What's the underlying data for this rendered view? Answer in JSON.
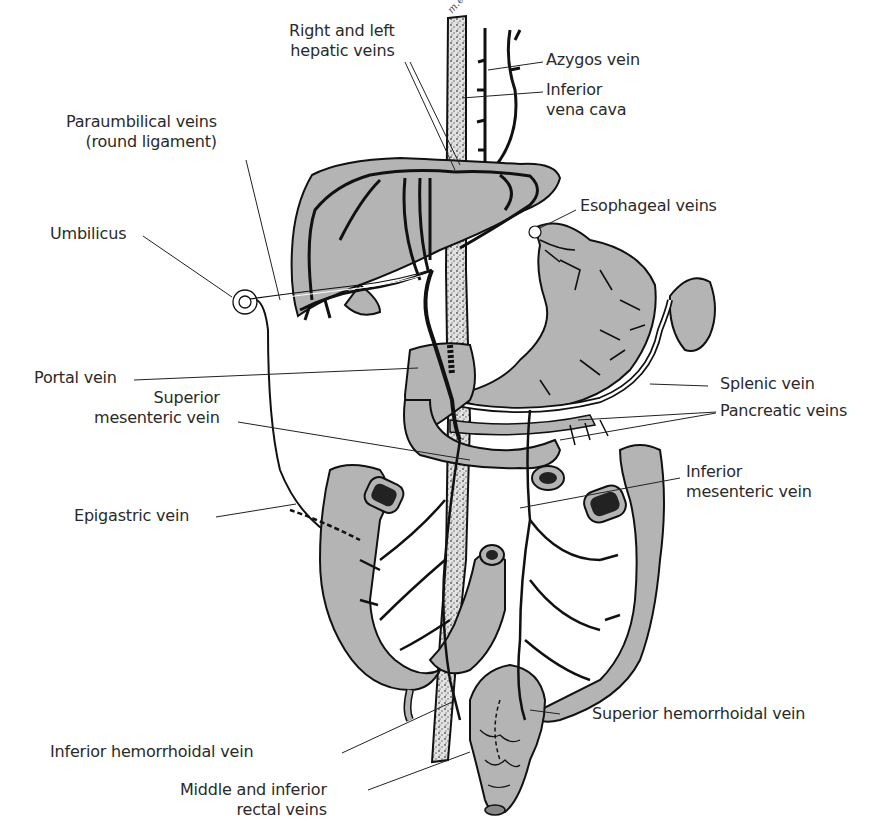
{
  "diagram": {
    "colors": {
      "organ_fill": "#b4b4b4",
      "vessel_stroke": "#111111",
      "ivc_fill": "#d8d8d8",
      "label_text": "#2a2a2a",
      "background": "#ffffff"
    },
    "signature": "m.e.",
    "labels": {
      "hepatic_veins": {
        "line1": "Right and left",
        "line2": "hepatic veins"
      },
      "azygos": {
        "line1": "Azygos vein"
      },
      "ivc": {
        "line1": "Inferior",
        "line2": "vena cava"
      },
      "paraumbilical": {
        "line1": "Paraumbilical veins",
        "line2": "(round ligament)"
      },
      "esophageal": {
        "line1": "Esophageal veins"
      },
      "umbilicus": {
        "line1": "Umbilicus"
      },
      "portal": {
        "line1": "Portal vein"
      },
      "superior_mesenteric": {
        "line1": "Superior",
        "line2": "mesenteric vein"
      },
      "splenic": {
        "line1": "Splenic vein"
      },
      "pancreatic": {
        "line1": "Pancreatic veins"
      },
      "inferior_mesenteric": {
        "line1": "Inferior",
        "line2": "mesenteric vein"
      },
      "epigastric": {
        "line1": "Epigastric vein"
      },
      "superior_hemorrhoidal": {
        "line1": "Superior hemorrhoidal vein"
      },
      "inferior_hemorrhoidal": {
        "line1": "Inferior hemorrhoidal vein"
      },
      "middle_inferior_rectal": {
        "line1": "Middle and inferior",
        "line2": "rectal veins"
      }
    },
    "structures": [
      "liver",
      "stomach",
      "spleen",
      "pancreas",
      "inferior-vena-cava",
      "aorta",
      "transverse-colon",
      "ascending-colon",
      "descending-colon",
      "sigmoid-colon",
      "small-intestine",
      "rectum",
      "umbilicus"
    ]
  }
}
